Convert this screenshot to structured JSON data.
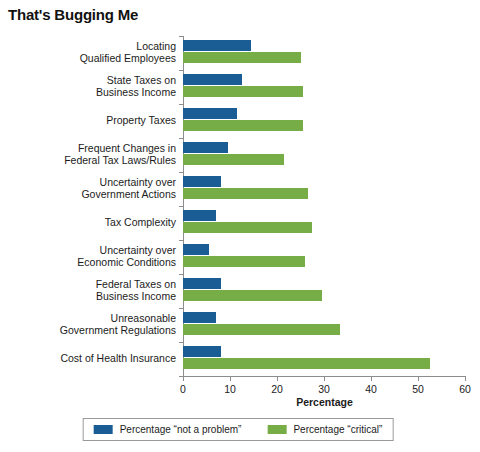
{
  "chart_data": {
    "type": "bar",
    "orientation": "horizontal",
    "title": "That's Bugging Me",
    "xlabel": "Percentage",
    "ylabel": "Small Business Problem",
    "xlim": [
      0,
      60
    ],
    "xticks": [
      0,
      10,
      20,
      30,
      40,
      50,
      60
    ],
    "xtick_labels": [
      "0",
      "10",
      "20",
      "30",
      "40",
      "50",
      "60"
    ],
    "grid": false,
    "legend_position": "bottom",
    "colors": {
      "not_a_problem": "#1a5c94",
      "critical": "#77ad46"
    },
    "categories": [
      "Locating\nQualified Employees",
      "State Taxes on\nBusiness Income",
      "Property Taxes",
      "Frequent Changes in\nFederal Tax Laws/Rules",
      "Uncertainty over\nGovernment Actions",
      "Tax Complexity",
      "Uncertainty over\nEconomic Conditions",
      "Federal Taxes on\nBusiness Income",
      "Unreasonable\nGovernment Regulations",
      "Cost of Health Insurance"
    ],
    "category_lines": [
      [
        "Locating",
        "Qualified Employees"
      ],
      [
        "State Taxes on",
        "Business Income"
      ],
      [
        "Property Taxes"
      ],
      [
        "Frequent Changes in",
        "Federal Tax Laws/Rules"
      ],
      [
        "Uncertainty over",
        "Government Actions"
      ],
      [
        "Tax Complexity"
      ],
      [
        "Uncertainty over",
        "Economic Conditions"
      ],
      [
        "Federal Taxes on",
        "Business Income"
      ],
      [
        "Unreasonable",
        "Government Regulations"
      ],
      [
        "Cost of Health Insurance"
      ]
    ],
    "series": [
      {
        "name": "Percentage “not a problem”",
        "color": "#1a5c94",
        "values": [
          14.5,
          12.5,
          11.5,
          9.5,
          8.0,
          7.0,
          5.5,
          8.0,
          7.0,
          8.0
        ]
      },
      {
        "name": "Percentage “critical”",
        "color": "#77ad46",
        "values": [
          25.0,
          25.5,
          25.5,
          21.5,
          26.5,
          27.5,
          26.0,
          29.5,
          33.5,
          52.5
        ]
      }
    ]
  },
  "legend": {
    "items": [
      {
        "label": "Percentage “not a problem”",
        "color": "#1a5c94"
      },
      {
        "label": "Percentage “critical”",
        "color": "#77ad46"
      }
    ]
  }
}
